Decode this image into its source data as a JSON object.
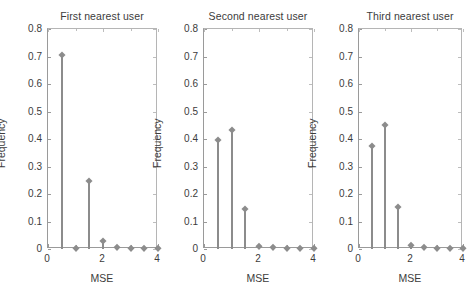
{
  "figure": {
    "background": "#ffffff",
    "series_color": "#8c8c8c",
    "axis_color": "#9a9a9a",
    "text_color": "#3c3c3c"
  },
  "axis_common": {
    "xlabel": "MSE",
    "ylabel": "Frequency",
    "xlim": [
      0,
      4
    ],
    "ylim": [
      0,
      0.8
    ],
    "xticks": [
      0,
      2,
      4
    ],
    "xticklabels": [
      "0",
      "2",
      "4"
    ],
    "yticks": [
      0,
      0.1,
      0.2,
      0.3,
      0.4,
      0.5,
      0.6,
      0.7,
      0.8
    ],
    "yticklabels": [
      "0",
      "0.1",
      "0.2",
      "0.3",
      "0.4",
      "0.5",
      "0.6",
      "0.7",
      "0.8"
    ],
    "grid": false
  },
  "chart_data": [
    {
      "type": "bar",
      "title": "First nearest user",
      "xlabel": "MSE",
      "ylabel": "Frequency",
      "xlim": [
        0,
        4
      ],
      "ylim": [
        0,
        0.8
      ],
      "x": [
        0.5,
        1.0,
        1.5,
        2.0,
        2.5,
        3.0,
        3.5,
        4.0
      ],
      "values": [
        0.705,
        0.003,
        0.249,
        0.029,
        0.008,
        0.004,
        0.002,
        0.002
      ],
      "categories": [
        "0.5",
        "1",
        "1.5",
        "2",
        "2.5",
        "3",
        "3.5",
        "4"
      ],
      "xticklabels": [
        "0",
        "2",
        "4"
      ],
      "yticklabels": [
        "0",
        "0.1",
        "0.2",
        "0.3",
        "0.4",
        "0.5",
        "0.6",
        "0.7",
        "0.8"
      ],
      "grid": false,
      "legend": null
    },
    {
      "type": "bar",
      "title": "Second nearest user",
      "xlabel": "MSE",
      "ylabel": "Frequency",
      "xlim": [
        0,
        4
      ],
      "ylim": [
        0,
        0.8
      ],
      "x": [
        0.5,
        1.0,
        1.5,
        2.0,
        2.5,
        3.0,
        3.5,
        4.0
      ],
      "values": [
        0.398,
        0.431,
        0.146,
        0.012,
        0.006,
        0.004,
        0.002,
        0.002
      ],
      "categories": [
        "0.5",
        "1",
        "1.5",
        "2",
        "2.5",
        "3",
        "3.5",
        "4"
      ],
      "xticklabels": [
        "0",
        "2",
        "4"
      ],
      "yticklabels": [
        "0",
        "0.1",
        "0.2",
        "0.3",
        "0.4",
        "0.5",
        "0.6",
        "0.7",
        "0.8"
      ],
      "grid": false,
      "legend": null
    },
    {
      "type": "bar",
      "title": "Third nearest user",
      "xlabel": "MSE",
      "ylabel": "Frequency",
      "xlim": [
        0,
        4
      ],
      "ylim": [
        0,
        0.8
      ],
      "x": [
        0.5,
        1.0,
        1.5,
        2.0,
        2.5,
        3.0,
        3.5,
        4.0
      ],
      "values": [
        0.373,
        0.452,
        0.153,
        0.013,
        0.006,
        0.004,
        0.002,
        0.002
      ],
      "categories": [
        "0.5",
        "1",
        "1.5",
        "2",
        "2.5",
        "3",
        "3.5",
        "4"
      ],
      "xticklabels": [
        "0",
        "2",
        "4"
      ],
      "yticklabels": [
        "0",
        "0.1",
        "0.2",
        "0.3",
        "0.4",
        "0.5",
        "0.6",
        "0.7",
        "0.8"
      ],
      "grid": false,
      "legend": null
    }
  ]
}
